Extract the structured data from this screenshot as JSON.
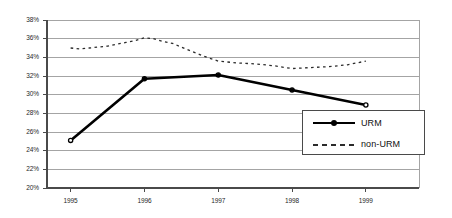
{
  "chart_data": {
    "type": "line",
    "title": "",
    "subtitle": "",
    "xlabel": "",
    "ylabel": "",
    "categories": [
      "1995",
      "1996",
      "1997",
      "1998",
      "1999"
    ],
    "x": [
      1995,
      1996,
      1997,
      1998,
      1999
    ],
    "xlim": [
      1994.68,
      1999.72
    ],
    "ylim": [
      20,
      38
    ],
    "y_tick_step": 2,
    "y_ticks": [
      "20%",
      "22%",
      "24%",
      "26%",
      "28%",
      "30%",
      "32%",
      "34%",
      "36%",
      "38%"
    ],
    "y_tick_values": [
      20,
      22,
      24,
      26,
      28,
      30,
      32,
      34,
      36,
      38
    ],
    "x_ticks": [
      "1995",
      "1996",
      "1997",
      "1998",
      "1999"
    ],
    "grid": "horizontal",
    "legend_position": "inside-bottom-right",
    "series": [
      {
        "name": "URM",
        "style": "solid",
        "color": "#000000",
        "line_width": 2.6,
        "marker": "circle",
        "values": [
          25.1,
          31.7,
          32.1,
          30.5,
          28.9
        ],
        "points": [
          {
            "x": 1995,
            "y": 25.1
          },
          {
            "x": 1996,
            "y": 31.7
          },
          {
            "x": 1997,
            "y": 32.1
          },
          {
            "x": 1998,
            "y": 30.5
          },
          {
            "x": 1999,
            "y": 28.9
          }
        ]
      },
      {
        "name": "non-URM",
        "style": "dotted",
        "color": "#2b2b2b",
        "line_width": 1.3,
        "marker": "none",
        "values": [
          35.0,
          36.1,
          33.6,
          32.8,
          33.6
        ],
        "points": [
          {
            "x": 1995.0,
            "y": 35.0
          },
          {
            "x": 1995.12,
            "y": 34.9
          },
          {
            "x": 1995.25,
            "y": 35.0
          },
          {
            "x": 1995.38,
            "y": 35.1
          },
          {
            "x": 1995.5,
            "y": 35.2
          },
          {
            "x": 1995.62,
            "y": 35.4
          },
          {
            "x": 1995.75,
            "y": 35.6
          },
          {
            "x": 1995.88,
            "y": 35.8
          },
          {
            "x": 1996.0,
            "y": 36.1
          },
          {
            "x": 1996.12,
            "y": 36.0
          },
          {
            "x": 1996.25,
            "y": 35.7
          },
          {
            "x": 1996.38,
            "y": 35.5
          },
          {
            "x": 1996.5,
            "y": 35.1
          },
          {
            "x": 1996.62,
            "y": 34.7
          },
          {
            "x": 1996.75,
            "y": 34.3
          },
          {
            "x": 1996.88,
            "y": 33.9
          },
          {
            "x": 1997.0,
            "y": 33.6
          },
          {
            "x": 1997.25,
            "y": 33.4
          },
          {
            "x": 1997.5,
            "y": 33.3
          },
          {
            "x": 1997.75,
            "y": 33.1
          },
          {
            "x": 1998.0,
            "y": 32.8
          },
          {
            "x": 1998.25,
            "y": 32.9
          },
          {
            "x": 1998.5,
            "y": 33.0
          },
          {
            "x": 1998.75,
            "y": 33.2
          },
          {
            "x": 1999.0,
            "y": 33.6
          }
        ]
      }
    ],
    "legend_entries": [
      {
        "label": "URM",
        "style": "solid",
        "marker": "circle"
      },
      {
        "label": "non-URM",
        "style": "dotted",
        "marker": "none"
      }
    ],
    "colors": {
      "background": "#ffffff",
      "plot_background": "#ffffff",
      "grid_line": "#8d8d8d",
      "axis_line": "#4a4a4a",
      "series_urm": "#000000",
      "series_non_urm": "#2b2b2b",
      "tick_label": "#1f1f1f",
      "legend_border": "#4a4a4a"
    }
  },
  "plot_geometry": {
    "left": 47,
    "right": 419,
    "top": 20,
    "bottom": 188
  },
  "legend": {
    "box": {
      "left": 302,
      "top": 110,
      "width": 123,
      "height": 45
    }
  }
}
